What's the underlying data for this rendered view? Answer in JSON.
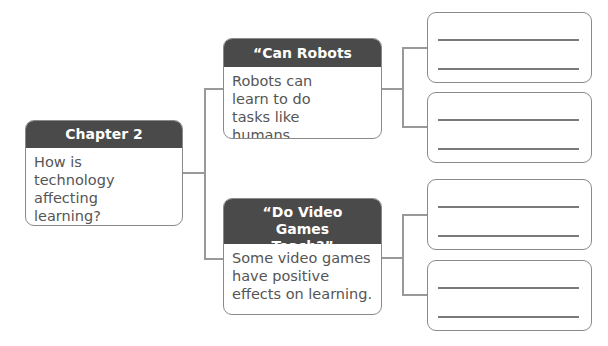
{
  "main": {
    "title": "Chapter 2",
    "question": "How is technology affecting learning?"
  },
  "branches": [
    {
      "title": "“Can Robots Learn?”",
      "text": "Robots can learn to do tasks like humans."
    },
    {
      "title": "“Do Video Games Teach?”",
      "text": "Some video games have positive effects on learning."
    }
  ],
  "answer_boxes": [
    {
      "lines": 2
    },
    {
      "lines": 2
    },
    {
      "lines": 2
    },
    {
      "lines": 2
    }
  ],
  "colors": {
    "header_bg": "#4a4a4a",
    "border": "#8a8a8a",
    "body_text": "#555555"
  }
}
